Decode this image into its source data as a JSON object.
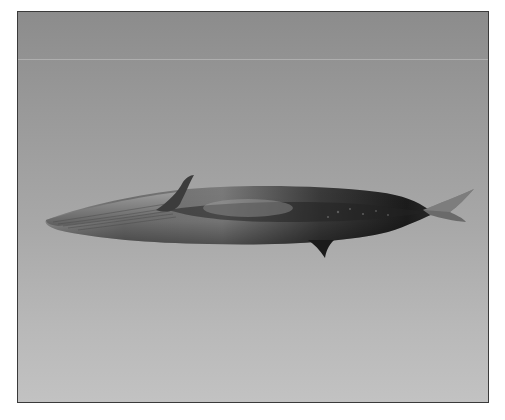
{
  "image": {
    "subject": "fin whale 3D render",
    "background": {
      "top_color": "#8c8c8c",
      "bottom_color": "#c2c2c2",
      "frame_color": "#3a3a3a"
    },
    "whale": {
      "body_dark": "#1e1e1e",
      "body_mid": "#5a5a5a",
      "body_light": "#9a9a9a",
      "orientation": "facing left, horizontal"
    }
  }
}
